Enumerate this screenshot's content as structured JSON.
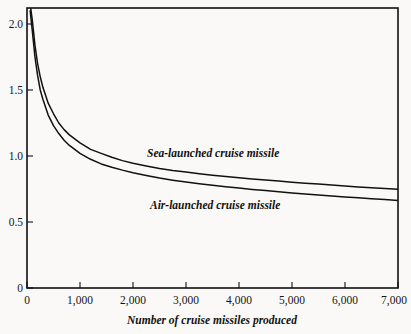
{
  "chart_data": {
    "type": "line",
    "title": "",
    "subtitle": "",
    "xlabel": "Number of cruise missiles produced",
    "ylabel": "",
    "xlim": [
      0,
      7000
    ],
    "ylim": [
      0,
      2.15
    ],
    "grid": false,
    "legend_position": "inline-annotation",
    "x_ticks": [
      0,
      1000,
      2000,
      3000,
      4000,
      5000,
      6000,
      7000
    ],
    "x_tick_labels": [
      "0",
      "1,000",
      "2,000",
      "3,000",
      "4,000",
      "5,000",
      "6,000",
      "7,000"
    ],
    "y_ticks": [
      0,
      0.5,
      1.0,
      1.5,
      2.0
    ],
    "y_tick_labels": [
      "0",
      "0.5",
      "1.0",
      "1.5",
      "2.0"
    ],
    "series": [
      {
        "name": "Sea-launched cruise missile",
        "label": "Sea-launched cruise missile",
        "color": "#111111",
        "annotation_x": 2300,
        "annotation_y": 1.07,
        "x": [
          60,
          100,
          150,
          200,
          250,
          300,
          400,
          500,
          600,
          700,
          800,
          900,
          1000,
          1200,
          1400,
          1600,
          1800,
          2000,
          2250,
          2500,
          2750,
          3000,
          3250,
          3500,
          3750,
          4000,
          4250,
          4500,
          4750,
          5000,
          5250,
          5500,
          5750,
          6000,
          6250,
          6500,
          6750,
          7000
        ],
        "y": [
          2.15,
          2.03,
          1.84,
          1.7,
          1.6,
          1.52,
          1.4,
          1.32,
          1.25,
          1.2,
          1.16,
          1.13,
          1.1,
          1.05,
          1.02,
          0.99,
          0.965,
          0.945,
          0.925,
          0.905,
          0.89,
          0.878,
          0.866,
          0.855,
          0.845,
          0.835,
          0.826,
          0.818,
          0.81,
          0.802,
          0.794,
          0.787,
          0.78,
          0.773,
          0.766,
          0.76,
          0.754,
          0.748
        ]
      },
      {
        "name": "Air-launched cruise missile",
        "label": "Air-launched cruise missile",
        "color": "#111111",
        "annotation_x": 2250,
        "annotation_y": 0.735,
        "x": [
          60,
          100,
          150,
          200,
          250,
          300,
          400,
          500,
          600,
          700,
          800,
          900,
          1000,
          1200,
          1400,
          1600,
          1800,
          2000,
          2250,
          2500,
          2750,
          3000,
          3250,
          3500,
          3750,
          4000,
          4250,
          4500,
          4750,
          5000,
          5250,
          5500,
          5750,
          6000,
          6250,
          6500,
          6750,
          7000
        ],
        "y": [
          2.1,
          1.95,
          1.75,
          1.61,
          1.5,
          1.43,
          1.31,
          1.23,
          1.17,
          1.12,
          1.08,
          1.05,
          1.02,
          0.975,
          0.94,
          0.915,
          0.893,
          0.873,
          0.852,
          0.833,
          0.817,
          0.803,
          0.79,
          0.778,
          0.767,
          0.757,
          0.747,
          0.738,
          0.729,
          0.72,
          0.712,
          0.704,
          0.697,
          0.69,
          0.683,
          0.676,
          0.67,
          0.663
        ]
      }
    ]
  },
  "figure": {
    "background_color": "#faf9f7",
    "axis_color": "#111111",
    "x_axis_title": "Number of cruise missiles produced"
  }
}
